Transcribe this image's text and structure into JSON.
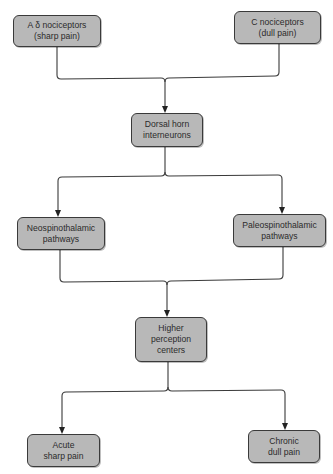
{
  "diagram": {
    "type": "flowchart",
    "colors": {
      "node_fill": "#b8b8b8",
      "node_border": "#3a3a3a",
      "line": "#3a3a3a",
      "background": "#ffffff"
    },
    "nodes": {
      "a_delta": {
        "label": "A δ nociceptors\n(sharp pain)"
      },
      "c_noci": {
        "label": "C nociceptors\n(dull pain)"
      },
      "dorsal_horn": {
        "label": "Dorsal horn\ninterneurons"
      },
      "neospino": {
        "label": "Neospinothalamic\npathways"
      },
      "paleospino": {
        "label": "Paleospinothalamic\npathways"
      },
      "higher": {
        "label": "Higher\nperception\ncenters"
      },
      "acute": {
        "label": "Acute\nsharp pain"
      },
      "chronic": {
        "label": "Chronic\ndull pain"
      }
    },
    "edges": [
      {
        "from": "a_delta",
        "to": "dorsal_horn"
      },
      {
        "from": "c_noci",
        "to": "dorsal_horn"
      },
      {
        "from": "dorsal_horn",
        "to": "neospino"
      },
      {
        "from": "dorsal_horn",
        "to": "paleospino"
      },
      {
        "from": "neospino",
        "to": "higher"
      },
      {
        "from": "paleospino",
        "to": "higher"
      },
      {
        "from": "higher",
        "to": "acute"
      },
      {
        "from": "higher",
        "to": "chronic"
      }
    ]
  }
}
